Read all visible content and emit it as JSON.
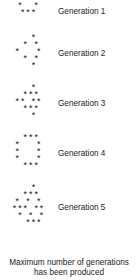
{
  "document": {
    "kind": "generation-pattern-listing",
    "text_color": "#1a1a1a",
    "background_color": "#ffffff",
    "star_glyph": "*"
  },
  "generations": [
    {
      "label": "Generation 1",
      "rows": [
        "*  *",
        "***"
      ]
    },
    {
      "label": "Generation 2",
      "rows": [
        "  *",
        " * *",
        "*   *",
        " * *",
        "  *"
      ]
    },
    {
      "label": "Generation 3",
      "rows": [
        "  *",
        " ***",
        "** **",
        " ***",
        "  *"
      ]
    },
    {
      "label": "Generation 4",
      "rows": [
        " ***",
        "*   *",
        "*   *",
        "*   *",
        " ***"
      ]
    },
    {
      "label": "Generation 5",
      "rows": [
        "  *",
        " ***",
        "* * *",
        "*** **",
        " * * *",
        "  ***"
      ]
    }
  ],
  "footer": {
    "line1": "Maximum number of generations",
    "line2": "has been produced"
  }
}
